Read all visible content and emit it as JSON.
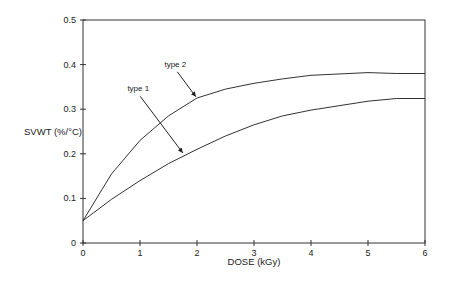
{
  "chart_data": {
    "type": "line",
    "title": "",
    "xlabel": "DOSE (kGy)",
    "ylabel": "SVWT (%/°C)",
    "xlim": [
      0,
      6
    ],
    "ylim": [
      0,
      0.5
    ],
    "xticks": [
      0,
      1,
      2,
      3,
      4,
      5,
      6
    ],
    "xtick_labels": [
      "0",
      "1",
      "2",
      "3",
      "4",
      "5",
      "6"
    ],
    "yticks": [
      0,
      0.1,
      0.2,
      0.3,
      0.4,
      0.5
    ],
    "ytick_labels": [
      "0",
      "0.1",
      "0.2",
      "0.3",
      "0.4",
      "0.5"
    ],
    "grid": false,
    "legend": "none",
    "series": [
      {
        "name": "type 2",
        "x": [
          0,
          0.5,
          1,
          1.5,
          2,
          2.5,
          3,
          3.5,
          4,
          5,
          5.5,
          6
        ],
        "y": [
          0.05,
          0.155,
          0.23,
          0.285,
          0.325,
          0.345,
          0.358,
          0.368,
          0.376,
          0.382,
          0.38,
          0.38
        ]
      },
      {
        "name": "type 1",
        "x": [
          0,
          0.5,
          1,
          1.5,
          2,
          2.5,
          3,
          3.5,
          4,
          5,
          5.5,
          6
        ],
        "y": [
          0.05,
          0.098,
          0.14,
          0.178,
          0.21,
          0.24,
          0.265,
          0.285,
          0.298,
          0.318,
          0.324,
          0.324
        ]
      }
    ],
    "annotations": [
      {
        "text": "type 2",
        "label_at": [
          1.62,
          0.395
        ],
        "arrow_to": [
          1.98,
          0.328
        ]
      },
      {
        "text": "type 1",
        "label_at": [
          0.97,
          0.34
        ],
        "arrow_to": [
          1.75,
          0.202
        ]
      }
    ]
  }
}
